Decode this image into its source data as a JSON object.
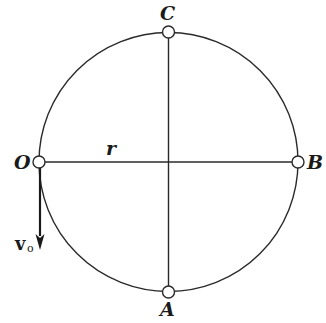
{
  "diagram": {
    "type": "circular-path-kinematics",
    "circle": {
      "cx": 168.5,
      "cy": 162,
      "r": 129.5,
      "stroke": "#2a2a2a"
    },
    "points": [
      {
        "id": "O",
        "label": "O",
        "x": 39,
        "y": 162
      },
      {
        "id": "B",
        "label": "B",
        "x": 298,
        "y": 162
      },
      {
        "id": "C",
        "label": "C",
        "x": 168.5,
        "y": 32
      },
      {
        "id": "A",
        "label": "A",
        "x": 168.5,
        "y": 292
      }
    ],
    "labels": {
      "O": "O",
      "B": "B",
      "C": "C",
      "A": "A",
      "radius": "r",
      "velocity_main": "v",
      "velocity_sub": "o"
    },
    "lines": [
      {
        "name": "horizontal-diameter",
        "from": "O",
        "to": "B"
      },
      {
        "name": "vertical-diameter",
        "from": "C",
        "to": "A"
      }
    ],
    "velocity_arrow": {
      "from": [
        40,
        168
      ],
      "to": [
        40,
        250
      ],
      "direction": "down"
    }
  }
}
